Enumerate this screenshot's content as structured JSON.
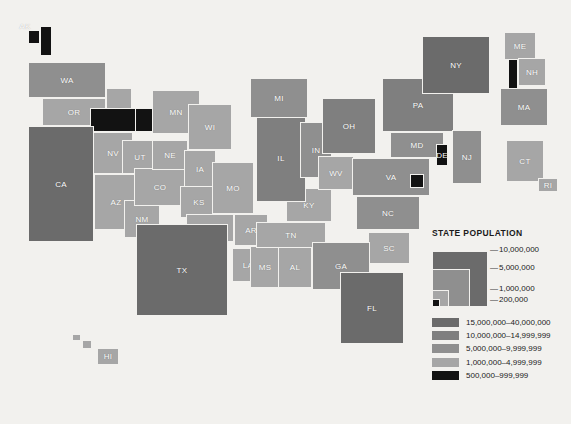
{
  "map": {
    "title": "United States state population choropleth map",
    "colors": {
      "bg": "#f2f1ee",
      "border": "#f2f1ee",
      "c15_40m": "#6b6b6b",
      "c10_15m": "#7f7f7f",
      "c5_10m": "#8f8f8f",
      "c1_5m": "#a6a6a6",
      "c500_999k": "#121212",
      "label": "#ffffff"
    },
    "states": [
      {
        "code": "AK",
        "x": 28,
        "y": 30,
        "w": 12,
        "h": 14,
        "class": "c500_999k",
        "label_dx": -9,
        "label_dy": -11
      },
      {
        "code": "AK2",
        "x": 40,
        "y": 26,
        "w": 12,
        "h": 30,
        "class": "c500_999k",
        "label": ""
      },
      {
        "code": "HI",
        "x": 97,
        "y": 348,
        "w": 22,
        "h": 17,
        "class": "c1_5m"
      },
      {
        "code": "HI2",
        "x": 82,
        "y": 340,
        "w": 10,
        "h": 9,
        "class": "c1_5m",
        "label": ""
      },
      {
        "code": "HI3",
        "x": 72,
        "y": 334,
        "w": 9,
        "h": 7,
        "class": "c1_5m",
        "label": ""
      },
      {
        "code": "WA",
        "x": 28,
        "y": 62,
        "w": 78,
        "h": 36,
        "class": "c5_10m"
      },
      {
        "code": "OR",
        "x": 42,
        "y": 98,
        "w": 64,
        "h": 28,
        "class": "c1_5m"
      },
      {
        "code": "ID",
        "x": 106,
        "y": 88,
        "w": 26,
        "h": 44,
        "class": "c1_5m"
      },
      {
        "code": "MT",
        "x": 113,
        "y": 108,
        "w": 50,
        "h": 24,
        "class": "c500_999k",
        "label": ""
      },
      {
        "code": "MT2",
        "x": 90,
        "y": 108,
        "w": 46,
        "h": 24,
        "class": "c500_999k",
        "label": ""
      },
      {
        "code": "NV",
        "x": 93,
        "y": 132,
        "w": 40,
        "h": 42,
        "class": "c1_5m"
      },
      {
        "code": "CA",
        "x": 28,
        "y": 126,
        "w": 66,
        "h": 116,
        "class": "c15_40m"
      },
      {
        "code": "UT",
        "x": 122,
        "y": 140,
        "w": 36,
        "h": 34,
        "class": "c1_5m"
      },
      {
        "code": "AZ",
        "x": 94,
        "y": 174,
        "w": 44,
        "h": 56,
        "class": "c1_5m"
      },
      {
        "code": "NM",
        "x": 124,
        "y": 200,
        "w": 36,
        "h": 38,
        "class": "c1_5m"
      },
      {
        "code": "CO",
        "x": 134,
        "y": 168,
        "w": 52,
        "h": 38,
        "class": "c1_5m"
      },
      {
        "code": "NE",
        "x": 152,
        "y": 140,
        "w": 36,
        "h": 30,
        "class": "c1_5m"
      },
      {
        "code": "MN",
        "x": 152,
        "y": 90,
        "w": 48,
        "h": 44,
        "class": "c1_5m"
      },
      {
        "code": "WI",
        "x": 188,
        "y": 104,
        "w": 44,
        "h": 46,
        "class": "c1_5m"
      },
      {
        "code": "IA",
        "x": 184,
        "y": 150,
        "w": 32,
        "h": 38,
        "class": "c1_5m"
      },
      {
        "code": "KS",
        "x": 180,
        "y": 186,
        "w": 38,
        "h": 32,
        "class": "c1_5m"
      },
      {
        "code": "MO",
        "x": 212,
        "y": 162,
        "w": 42,
        "h": 52,
        "class": "c1_5m"
      },
      {
        "code": "OK",
        "x": 186,
        "y": 214,
        "w": 48,
        "h": 28,
        "class": "c1_5m"
      },
      {
        "code": "TX",
        "x": 136,
        "y": 224,
        "w": 92,
        "h": 92,
        "class": "c15_40m"
      },
      {
        "code": "AR",
        "x": 234,
        "y": 214,
        "w": 34,
        "h": 32,
        "class": "c1_5m"
      },
      {
        "code": "LA",
        "x": 232,
        "y": 248,
        "w": 32,
        "h": 34,
        "class": "c1_5m"
      },
      {
        "code": "MS",
        "x": 250,
        "y": 246,
        "w": 30,
        "h": 42,
        "class": "c1_5m"
      },
      {
        "code": "AL",
        "x": 278,
        "y": 246,
        "w": 34,
        "h": 42,
        "class": "c1_5m"
      },
      {
        "code": "TN",
        "x": 256,
        "y": 222,
        "w": 70,
        "h": 26,
        "class": "c1_5m"
      },
      {
        "code": "KY",
        "x": 286,
        "y": 188,
        "w": 46,
        "h": 34,
        "class": "c1_5m"
      },
      {
        "code": "IL",
        "x": 256,
        "y": 114,
        "w": 50,
        "h": 88,
        "class": "c10_15m"
      },
      {
        "code": "MI",
        "x": 250,
        "y": 78,
        "w": 58,
        "h": 40,
        "class": "c5_10m"
      },
      {
        "code": "IN",
        "x": 300,
        "y": 122,
        "w": 32,
        "h": 56,
        "class": "c5_10m"
      },
      {
        "code": "OH",
        "x": 322,
        "y": 98,
        "w": 54,
        "h": 56,
        "class": "c10_15m"
      },
      {
        "code": "PA",
        "x": 382,
        "y": 78,
        "w": 72,
        "h": 54,
        "class": "c10_15m"
      },
      {
        "code": "WV",
        "x": 318,
        "y": 156,
        "w": 36,
        "h": 34,
        "class": "c1_5m"
      },
      {
        "code": "VA",
        "x": 352,
        "y": 158,
        "w": 78,
        "h": 38,
        "class": "c5_10m"
      },
      {
        "code": "MD",
        "x": 390,
        "y": 132,
        "w": 54,
        "h": 26,
        "class": "c5_10m"
      },
      {
        "code": "DE",
        "x": 436,
        "y": 144,
        "w": 12,
        "h": 22,
        "class": "c500_999k"
      },
      {
        "code": "DC",
        "x": 410,
        "y": 174,
        "w": 14,
        "h": 14,
        "class": "c500_999k",
        "label": ""
      },
      {
        "code": "NJ",
        "x": 452,
        "y": 130,
        "w": 30,
        "h": 54,
        "class": "c5_10m"
      },
      {
        "code": "NY",
        "x": 422,
        "y": 36,
        "w": 68,
        "h": 58,
        "class": "c15_40m"
      },
      {
        "code": "VT",
        "x": 508,
        "y": 58,
        "w": 10,
        "h": 32,
        "class": "c500_999k",
        "label": ""
      },
      {
        "code": "ME",
        "x": 504,
        "y": 32,
        "w": 32,
        "h": 28,
        "class": "c1_5m"
      },
      {
        "code": "NH",
        "x": 518,
        "y": 58,
        "w": 28,
        "h": 28,
        "class": "c1_5m"
      },
      {
        "code": "MA",
        "x": 500,
        "y": 88,
        "w": 48,
        "h": 38,
        "class": "c5_10m"
      },
      {
        "code": "CT",
        "x": 506,
        "y": 140,
        "w": 38,
        "h": 42,
        "class": "c1_5m"
      },
      {
        "code": "RI",
        "x": 538,
        "y": 178,
        "w": 20,
        "h": 14,
        "class": "c1_5m"
      },
      {
        "code": "NC",
        "x": 356,
        "y": 196,
        "w": 64,
        "h": 34,
        "class": "c5_10m"
      },
      {
        "code": "SC",
        "x": 368,
        "y": 232,
        "w": 42,
        "h": 32,
        "class": "c1_5m"
      },
      {
        "code": "GA",
        "x": 312,
        "y": 242,
        "w": 58,
        "h": 48,
        "class": "c5_10m"
      },
      {
        "code": "FL",
        "x": 340,
        "y": 272,
        "w": 64,
        "h": 72,
        "class": "c15_40m"
      }
    ]
  },
  "legend": {
    "title": "STATE POPULATION",
    "nested_ticks": [
      {
        "value": "10,000,000"
      },
      {
        "value": "5,000,000"
      },
      {
        "value": "1,000,000"
      },
      {
        "value": "200,000"
      }
    ],
    "classes": [
      {
        "color": "#6b6b6b",
        "range": "15,000,000–40,000,000"
      },
      {
        "color": "#7f7f7f",
        "range": "10,000,000–14,999,999"
      },
      {
        "color": "#8f8f8f",
        "range": "5,000,000–9,999,999"
      },
      {
        "color": "#a6a6a6",
        "range": "1,000,000–4,999,999"
      },
      {
        "color": "#121212",
        "range": "500,000–999,999"
      }
    ]
  },
  "chart_data": {
    "type": "heatmap",
    "title": "STATE POPULATION",
    "legend_position": "bottom-right",
    "bins": [
      {
        "label": "15,000,000–40,000,000",
        "color": "#6b6b6b",
        "min": 15000000,
        "max": 40000000
      },
      {
        "label": "10,000,000–14,999,999",
        "color": "#7f7f7f",
        "min": 10000000,
        "max": 14999999
      },
      {
        "label": "5,000,000–9,999,999",
        "color": "#8f8f8f",
        "min": 5000000,
        "max": 9999999
      },
      {
        "label": "1,000,000–4,999,999",
        "color": "#a6a6a6",
        "min": 1000000,
        "max": 4999999
      },
      {
        "label": "500,000–999,999",
        "color": "#121212",
        "min": 500000,
        "max": 999999
      }
    ],
    "categories": [
      "AK",
      "HI",
      "WA",
      "OR",
      "ID",
      "MT",
      "NV",
      "CA",
      "UT",
      "AZ",
      "NM",
      "CO",
      "NE",
      "MN",
      "WI",
      "IA",
      "KS",
      "MO",
      "OK",
      "TX",
      "AR",
      "LA",
      "MS",
      "AL",
      "TN",
      "KY",
      "IL",
      "MI",
      "IN",
      "OH",
      "PA",
      "WV",
      "VA",
      "MD",
      "DE",
      "DC",
      "NJ",
      "NY",
      "VT",
      "ME",
      "NH",
      "MA",
      "CT",
      "RI",
      "NC",
      "SC",
      "GA",
      "FL"
    ],
    "values": [
      {
        "state": "AK",
        "bin": "500,000–999,999"
      },
      {
        "state": "HI",
        "bin": "1,000,000–4,999,999"
      },
      {
        "state": "WA",
        "bin": "5,000,000–9,999,999"
      },
      {
        "state": "OR",
        "bin": "1,000,000–4,999,999"
      },
      {
        "state": "ID",
        "bin": "1,000,000–4,999,999"
      },
      {
        "state": "MT",
        "bin": "500,000–999,999"
      },
      {
        "state": "NV",
        "bin": "1,000,000–4,999,999"
      },
      {
        "state": "CA",
        "bin": "15,000,000–40,000,000"
      },
      {
        "state": "UT",
        "bin": "1,000,000–4,999,999"
      },
      {
        "state": "AZ",
        "bin": "1,000,000–4,999,999"
      },
      {
        "state": "NM",
        "bin": "1,000,000–4,999,999"
      },
      {
        "state": "CO",
        "bin": "1,000,000–4,999,999"
      },
      {
        "state": "NE",
        "bin": "1,000,000–4,999,999"
      },
      {
        "state": "MN",
        "bin": "1,000,000–4,999,999"
      },
      {
        "state": "WI",
        "bin": "1,000,000–4,999,999"
      },
      {
        "state": "IA",
        "bin": "1,000,000–4,999,999"
      },
      {
        "state": "KS",
        "bin": "1,000,000–4,999,999"
      },
      {
        "state": "MO",
        "bin": "1,000,000–4,999,999"
      },
      {
        "state": "OK",
        "bin": "1,000,000–4,999,999"
      },
      {
        "state": "TX",
        "bin": "15,000,000–40,000,000"
      },
      {
        "state": "AR",
        "bin": "1,000,000–4,999,999"
      },
      {
        "state": "LA",
        "bin": "1,000,000–4,999,999"
      },
      {
        "state": "MS",
        "bin": "1,000,000–4,999,999"
      },
      {
        "state": "AL",
        "bin": "1,000,000–4,999,999"
      },
      {
        "state": "TN",
        "bin": "1,000,000–4,999,999"
      },
      {
        "state": "KY",
        "bin": "1,000,000–4,999,999"
      },
      {
        "state": "IL",
        "bin": "10,000,000–14,999,999"
      },
      {
        "state": "MI",
        "bin": "5,000,000–9,999,999"
      },
      {
        "state": "IN",
        "bin": "5,000,000–9,999,999"
      },
      {
        "state": "OH",
        "bin": "10,000,000–14,999,999"
      },
      {
        "state": "PA",
        "bin": "10,000,000–14,999,999"
      },
      {
        "state": "WV",
        "bin": "1,000,000–4,999,999"
      },
      {
        "state": "VA",
        "bin": "5,000,000–9,999,999"
      },
      {
        "state": "MD",
        "bin": "5,000,000–9,999,999"
      },
      {
        "state": "DE",
        "bin": "500,000–999,999"
      },
      {
        "state": "DC",
        "bin": "500,000–999,999"
      },
      {
        "state": "NJ",
        "bin": "5,000,000–9,999,999"
      },
      {
        "state": "NY",
        "bin": "15,000,000–40,000,000"
      },
      {
        "state": "VT",
        "bin": "500,000–999,999"
      },
      {
        "state": "ME",
        "bin": "1,000,000–4,999,999"
      },
      {
        "state": "NH",
        "bin": "1,000,000–4,999,999"
      },
      {
        "state": "MA",
        "bin": "5,000,000–9,999,999"
      },
      {
        "state": "CT",
        "bin": "1,000,000–4,999,999"
      },
      {
        "state": "RI",
        "bin": "1,000,000–4,999,999"
      },
      {
        "state": "NC",
        "bin": "5,000,000–9,999,999"
      },
      {
        "state": "SC",
        "bin": "1,000,000–4,999,999"
      },
      {
        "state": "GA",
        "bin": "5,000,000–9,999,999"
      },
      {
        "state": "FL",
        "bin": "15,000,000–40,000,000"
      }
    ]
  }
}
